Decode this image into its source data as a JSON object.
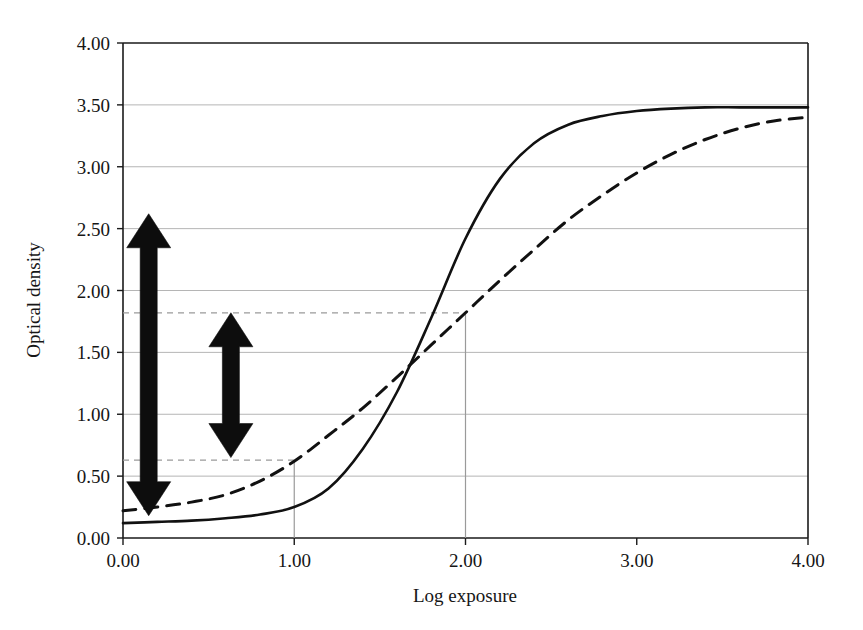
{
  "chart_data": {
    "type": "line",
    "title": "",
    "xlabel": "Log exposure",
    "ylabel": "Optical density",
    "xlim": [
      0,
      4
    ],
    "ylim": [
      0,
      4
    ],
    "xticks": [
      "0.00",
      "1.00",
      "2.00",
      "3.00",
      "4.00"
    ],
    "xtick_values": [
      0,
      1,
      2,
      3,
      4
    ],
    "yticks": [
      "0.00",
      "0.50",
      "1.00",
      "1.50",
      "2.00",
      "2.50",
      "3.00",
      "3.50",
      "4.00"
    ],
    "ytick_values": [
      0,
      0.5,
      1,
      1.5,
      2,
      2.5,
      3,
      3.5,
      4
    ],
    "grid": "horizontal",
    "legend": "none",
    "x": [
      0.0,
      0.2,
      0.4,
      0.6,
      0.8,
      1.0,
      1.2,
      1.4,
      1.6,
      1.8,
      2.0,
      2.2,
      2.4,
      2.6,
      2.8,
      3.0,
      3.2,
      3.4,
      3.6,
      3.8,
      4.0
    ],
    "series": [
      {
        "name": "high-contrast-film",
        "style": "solid",
        "color": "#111111",
        "values": [
          0.12,
          0.13,
          0.14,
          0.16,
          0.19,
          0.25,
          0.4,
          0.72,
          1.18,
          1.78,
          2.42,
          2.9,
          3.19,
          3.34,
          3.41,
          3.45,
          3.47,
          3.48,
          3.48,
          3.48,
          3.48
        ]
      },
      {
        "name": "low-contrast-film",
        "style": "dashed",
        "color": "#111111",
        "values": [
          0.22,
          0.25,
          0.29,
          0.35,
          0.46,
          0.62,
          0.83,
          1.05,
          1.3,
          1.56,
          1.82,
          2.08,
          2.33,
          2.57,
          2.77,
          2.95,
          3.1,
          3.22,
          3.31,
          3.37,
          3.4
        ]
      }
    ],
    "annotations": [
      {
        "name": "density-range-large",
        "type": "double-arrow",
        "x": 0.15,
        "y_low": 0.18,
        "y_high": 2.62,
        "color": "#0d0d0d"
      },
      {
        "name": "density-range-small",
        "type": "double-arrow",
        "x": 0.63,
        "y_low": 0.65,
        "y_high": 1.82,
        "color": "#0d0d0d"
      },
      {
        "name": "reference-line-upper",
        "type": "dashed-horizontal",
        "y": 1.82,
        "x_from": 0.0,
        "x_to": 2.0,
        "color": "#9a9a9a"
      },
      {
        "name": "reference-line-lower",
        "type": "dashed-horizontal",
        "y": 0.63,
        "x_from": 0.0,
        "x_to": 1.0,
        "color": "#9a9a9a"
      },
      {
        "name": "dropline-exposure-2",
        "type": "vertical",
        "x": 2.0,
        "y_from": 0.0,
        "y_to": 1.82,
        "color": "#9a9a9a"
      },
      {
        "name": "dropline-exposure-1",
        "type": "vertical",
        "x": 1.0,
        "y_from": 0.0,
        "y_to": 0.63,
        "color": "#9a9a9a"
      }
    ]
  },
  "styling": {
    "grid_color": "#b5b5b5",
    "axis_color": "#1a1a1a",
    "background": "#ffffff"
  }
}
